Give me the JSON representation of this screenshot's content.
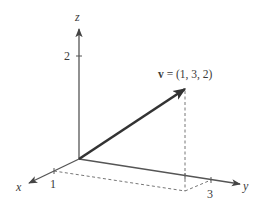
{
  "diagram": {
    "type": "3d-vector",
    "axes": {
      "x": {
        "label": "x",
        "tick_value": "1"
      },
      "y": {
        "label": "y",
        "tick_value": "3"
      },
      "z": {
        "label": "z",
        "tick_value": "2"
      }
    },
    "vector": {
      "name": "v",
      "equals": " = (1, 3, 2)",
      "components": [
        1,
        3,
        2
      ]
    },
    "colors": {
      "axis": "#555555",
      "vector": "#333333",
      "dashed": "#666666",
      "text": "#3a3a3a"
    }
  }
}
